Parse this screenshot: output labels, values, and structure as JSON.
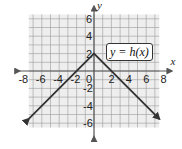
{
  "chart_data": {
    "type": "line",
    "title": "",
    "function_label": "y = h(x)",
    "xlabel": "x",
    "ylabel": "y",
    "xlim": [
      -8,
      8
    ],
    "ylim": [
      -6.5,
      6.5
    ],
    "x_ticks": [
      -8,
      -6,
      -4,
      -2,
      0,
      2,
      4,
      6,
      8
    ],
    "y_ticks": [
      -6,
      -4,
      -2,
      2,
      4,
      6
    ],
    "grid": true,
    "series": [
      {
        "name": "h(x)",
        "x": [
          -7.5,
          0,
          7.5
        ],
        "y": [
          -5.5,
          2,
          -5.5
        ],
        "arrows": "both-ends"
      }
    ],
    "vertex": [
      0,
      2
    ],
    "colors": {
      "grid_fill": "#eeeeee",
      "grid_line": "#9a9a9a",
      "line": "#333333",
      "axis": "#555555"
    }
  },
  "labels": {
    "fn": "y = h(x)",
    "x_axis": "x",
    "y_axis": "y",
    "x_ticks": [
      "-8",
      "-6",
      "-4",
      "-2",
      "0",
      "2",
      "4",
      "6",
      "8"
    ],
    "y_ticks": [
      "6",
      "4",
      "2",
      "-2",
      "-4",
      "-6"
    ]
  }
}
